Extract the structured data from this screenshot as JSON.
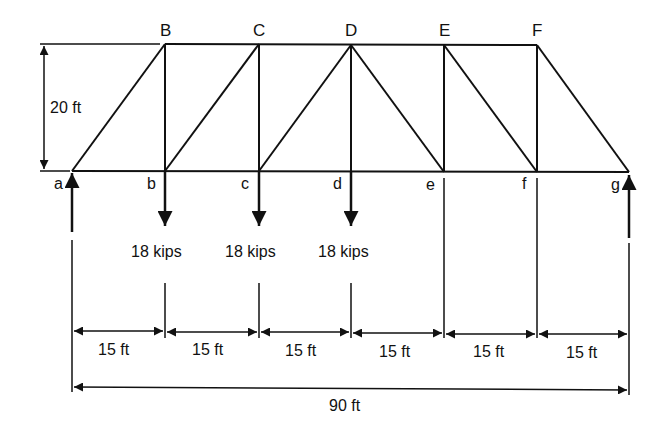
{
  "truss": {
    "top_nodes": [
      "B",
      "C",
      "D",
      "E",
      "F"
    ],
    "bottom_nodes": [
      "a",
      "b",
      "c",
      "d",
      "e",
      "f",
      "g"
    ],
    "height_label": "20 ft",
    "panel_label": "15 ft",
    "span_label": "90 ft",
    "panels": [
      "15 ft",
      "15 ft",
      "15 ft",
      "15 ft",
      "15 ft",
      "15 ft"
    ]
  },
  "loads": [
    {
      "node": "b",
      "label": "18 kips"
    },
    {
      "node": "c",
      "label": "18 kips"
    },
    {
      "node": "d",
      "label": "18 kips"
    }
  ],
  "supports": [
    {
      "node": "a",
      "type": "reaction-up"
    },
    {
      "node": "g",
      "type": "reaction-up"
    }
  ],
  "colors": {
    "line": "#111111",
    "background": "#ffffff"
  }
}
